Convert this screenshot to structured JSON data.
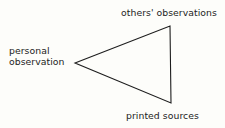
{
  "diagram": {
    "shape": {
      "name": "triangle",
      "orientation": "left-pointing",
      "stroke_color": "#1d1d1d",
      "stroke_width": 1.1,
      "fill": "none",
      "vertices": [
        {
          "name": "personal-observation-vertex",
          "x": 75,
          "y": 63
        },
        {
          "name": "others-observations-vertex",
          "x": 170,
          "y": 26
        },
        {
          "name": "printed-sources-vertex",
          "x": 171,
          "y": 103
        }
      ]
    },
    "background_color": "#fdfdfa",
    "text_color": "#232323",
    "labels": {
      "top": "others' observations",
      "left_line1": "personal",
      "left_line2": "observation",
      "left_full": "personal observation",
      "bottom": "printed sources"
    }
  }
}
